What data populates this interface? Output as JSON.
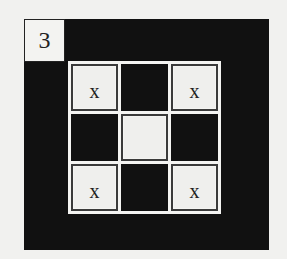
{
  "puzzle": {
    "number": "3",
    "colors": {
      "background": "#f1f1ef",
      "dark": "#111111",
      "light": "#efefed"
    },
    "grid": {
      "rows": 3,
      "cols": 3,
      "cells": [
        {
          "type": "light",
          "mark": "x"
        },
        {
          "type": "dark",
          "mark": ""
        },
        {
          "type": "light",
          "mark": "x"
        },
        {
          "type": "dark",
          "mark": ""
        },
        {
          "type": "light",
          "mark": ""
        },
        {
          "type": "dark",
          "mark": ""
        },
        {
          "type": "light",
          "mark": "x"
        },
        {
          "type": "dark",
          "mark": ""
        },
        {
          "type": "light",
          "mark": "x"
        }
      ]
    }
  }
}
